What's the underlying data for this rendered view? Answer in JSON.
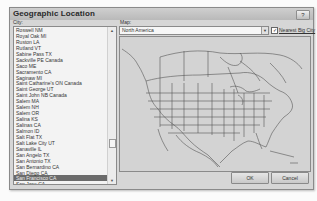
{
  "dialog": {
    "title": "Geographic Location",
    "help_label": "?"
  },
  "city": {
    "label": "City:",
    "items": [
      "Roswell NM",
      "Royal Oak MI",
      "Ruston LA",
      "Rutland VT",
      "Sabine Pass TX",
      "Sackville PE Canada",
      "Saco ME",
      "Sacramento CA",
      "Saginaw MI",
      "Saint Catharine's ON Canada",
      "Saint George UT",
      "Saint John NB Canada",
      "Salem MA",
      "Salem NH",
      "Salem OR",
      "Salina KS",
      "Salinas CA",
      "Salmon ID",
      "Salt Flat TX",
      "Salt Lake City UT",
      "Sanaville IL",
      "San Angelo TX",
      "San Antonio TX",
      "San Bernardino CA",
      "San Diego CA",
      "San Francisco CA",
      "San Jose CA"
    ],
    "selected_index": 25
  },
  "map": {
    "label": "Map:",
    "selected": "North America",
    "dropdown_arrow": "▼"
  },
  "nearest_big_city": {
    "label": "Nearest Big City",
    "checked": true,
    "check_glyph": "✓"
  },
  "buttons": {
    "ok": "OK",
    "cancel": "Cancel"
  },
  "scrollbar": {
    "up": "▲",
    "down": "▼"
  },
  "colors": {
    "dialog_bg": "#d6d6d6",
    "selection_bg": "#6b6b6b",
    "map_bg": "#d3d3d3",
    "map_lines": "#555555"
  }
}
